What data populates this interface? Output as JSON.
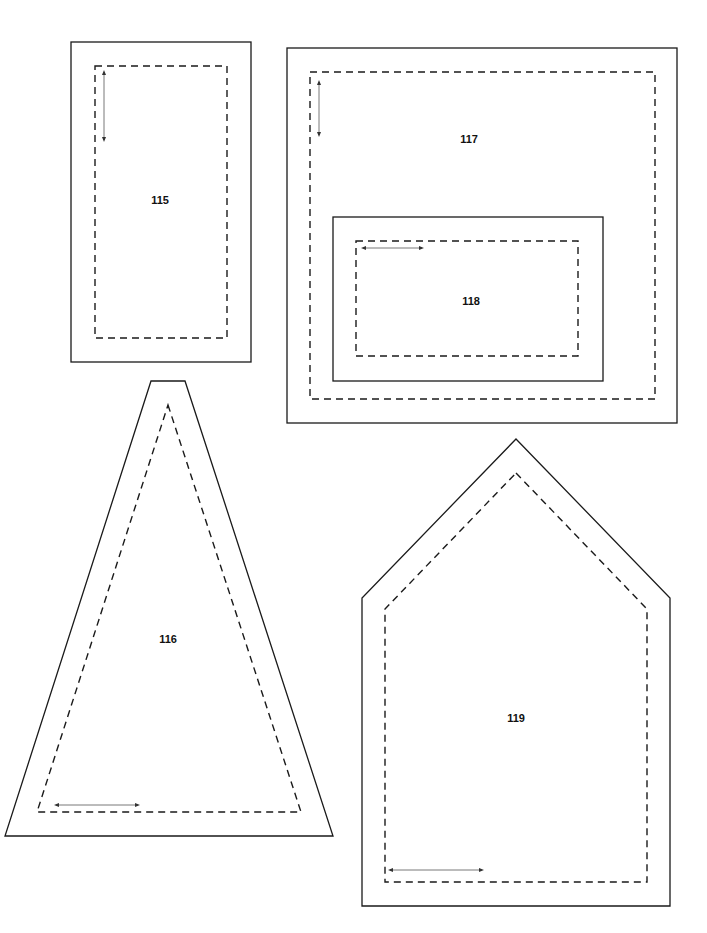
{
  "sheet": {
    "title": "Pattern template pieces",
    "background": "#ffffff",
    "line_color": "#1a1a1a"
  },
  "pieces": [
    {
      "id": "115",
      "label": "115",
      "shape": "rectangle"
    },
    {
      "id": "116",
      "label": "116",
      "shape": "triangle"
    },
    {
      "id": "117",
      "label": "117",
      "shape": "rectangle"
    },
    {
      "id": "118",
      "label": "118",
      "shape": "rectangle"
    },
    {
      "id": "119",
      "label": "119",
      "shape": "house"
    }
  ],
  "legend": {
    "solid_line": "cutting line",
    "dashed_line": "seam line",
    "arrow": "grain line"
  }
}
